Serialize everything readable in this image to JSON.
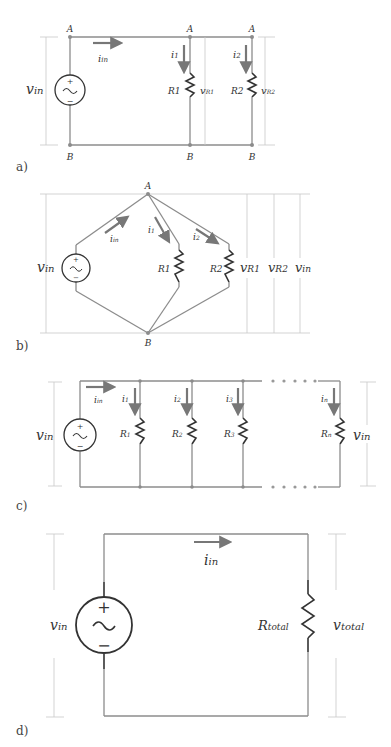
{
  "panels": {
    "a": {
      "label": "a)",
      "nodes": {
        "top": "A",
        "bottom": "B"
      },
      "source": {
        "voltage": "v",
        "voltage_sub": "in",
        "plus": "+",
        "minus": "−",
        "symbol": "~"
      },
      "current_in": {
        "main": "i",
        "sub": "in"
      },
      "branches": [
        {
          "resistor": "R1",
          "current": "i",
          "current_sub": "1",
          "voltage": "v",
          "voltage_sub": "R1"
        },
        {
          "resistor": "R2",
          "current": "i",
          "current_sub": "2",
          "voltage": "v",
          "voltage_sub": "R2"
        }
      ]
    },
    "b": {
      "label": "b)",
      "nodes": {
        "top": "A",
        "bottom": "B"
      },
      "source": {
        "voltage": "v",
        "voltage_sub": "in",
        "plus": "+",
        "minus": "−",
        "symbol": "~"
      },
      "current_in": {
        "main": "i",
        "sub": "in"
      },
      "branches": [
        {
          "resistor": "R1",
          "current": "i",
          "current_sub": "1"
        },
        {
          "resistor": "R2",
          "current": "i",
          "current_sub": "2"
        }
      ],
      "voltages": [
        {
          "main": "v",
          "sub": "R1"
        },
        {
          "main": "v",
          "sub": "R2"
        },
        {
          "main": "v",
          "sub": "in"
        }
      ]
    },
    "c": {
      "label": "c)",
      "source": {
        "voltage": "v",
        "voltage_sub": "in",
        "plus": "+",
        "minus": "−",
        "symbol": "~"
      },
      "current_in": {
        "main": "i",
        "sub": "in"
      },
      "branches": [
        {
          "resistor": "R",
          "resistor_sub": "1",
          "current": "i",
          "current_sub": "1"
        },
        {
          "resistor": "R",
          "resistor_sub": "2",
          "current": "i",
          "current_sub": "2"
        },
        {
          "resistor": "R",
          "resistor_sub": "3",
          "current": "i",
          "current_sub": "3"
        },
        {
          "resistor": "R",
          "resistor_sub": "n",
          "current": "i",
          "current_sub": "n"
        }
      ],
      "output_voltage": {
        "main": "v",
        "sub": "in"
      }
    },
    "d": {
      "label": "d)",
      "source": {
        "voltage": "v",
        "voltage_sub": "in",
        "plus": "+",
        "minus": "−",
        "symbol": "~"
      },
      "current_in": {
        "main": "i",
        "sub": "in"
      },
      "resistor": {
        "main": "R",
        "sub": "total"
      },
      "output_voltage": {
        "main": "v",
        "sub": "total"
      }
    }
  }
}
